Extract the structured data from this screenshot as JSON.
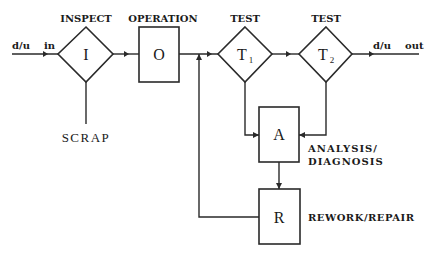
{
  "diagram": {
    "input": {
      "label": "in",
      "flow": "d/u"
    },
    "output": {
      "label": "out",
      "flow": "d/u"
    },
    "nodes": {
      "inspect": {
        "symbol": "I",
        "title": "INSPECT",
        "shape": "diamond"
      },
      "operation": {
        "symbol": "O",
        "title": "OPERATION",
        "shape": "box"
      },
      "test1": {
        "symbol": "T",
        "subscript": "1",
        "title": "TEST",
        "shape": "diamond"
      },
      "test2": {
        "symbol": "T",
        "subscript": "2",
        "title": "TEST",
        "shape": "diamond"
      },
      "analysis": {
        "symbol": "A",
        "title_line1": "ANALYSIS/",
        "title_line2": "DIAGNOSIS",
        "shape": "box"
      },
      "repair": {
        "symbol": "R",
        "title": "REWORK/REPAIR",
        "shape": "box"
      }
    },
    "scrap": {
      "label": "SCRAP"
    },
    "edges": [
      {
        "from": "input",
        "to": "inspect"
      },
      {
        "from": "inspect",
        "to": "operation"
      },
      {
        "from": "inspect",
        "to": "scrap"
      },
      {
        "from": "operation",
        "to": "test1"
      },
      {
        "from": "test1",
        "to": "test2"
      },
      {
        "from": "test2",
        "to": "output"
      },
      {
        "from": "test1",
        "to": "analysis"
      },
      {
        "from": "test2",
        "to": "analysis"
      },
      {
        "from": "analysis",
        "to": "repair"
      },
      {
        "from": "repair",
        "to": "test1"
      }
    ]
  }
}
